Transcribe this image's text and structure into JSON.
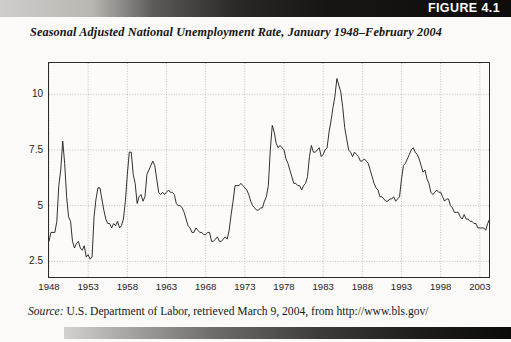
{
  "banner": {
    "figure_label": "FIGURE 4.1"
  },
  "chart_title": "Seasonal Adjusted National Unemployment Rate, January 1948–February 2004",
  "source": {
    "label": "Source:",
    "text": " U.S. Department of Labor, retrieved March 9, 2004, from http://www.bls.gov/"
  },
  "chart_data": {
    "type": "line",
    "title": "Seasonal Adjusted National Unemployment Rate, January 1948–February 2004",
    "xlabel": "",
    "ylabel": "",
    "xlim": [
      1948.0,
      2004.17
    ],
    "ylim": [
      1.8,
      11.4
    ],
    "ytick_labels": [
      "2.5",
      "5",
      "7.5",
      "10"
    ],
    "yticks": [
      2.5,
      5,
      7.5,
      10
    ],
    "xtick_labels": [
      "1948",
      "1953",
      "1958",
      "1963",
      "1968",
      "1973",
      "1978",
      "1983",
      "1988",
      "1993",
      "1998",
      "2003"
    ],
    "xticks": [
      1948,
      1953,
      1958,
      1963,
      1968,
      1973,
      1978,
      1983,
      1988,
      1993,
      1998,
      2003
    ],
    "grid": true,
    "grid_style": "dotted",
    "legend": "none",
    "line_color": "#1a1a1a",
    "series": [
      {
        "name": "Unemployment Rate (%)",
        "x_start": 1948.0,
        "x_step": 0.25,
        "units": "percent",
        "values": [
          3.4,
          3.8,
          3.8,
          3.8,
          4.3,
          5.9,
          6.6,
          7.9,
          6.9,
          5.4,
          4.5,
          4.3,
          3.4,
          3.1,
          3.3,
          3.4,
          3.1,
          3.0,
          3.2,
          2.7,
          2.8,
          2.6,
          2.7,
          4.5,
          5.3,
          5.8,
          5.8,
          5.3,
          4.8,
          4.4,
          4.2,
          4.2,
          4.0,
          4.2,
          4.1,
          4.3,
          4.0,
          4.1,
          4.4,
          5.2,
          6.4,
          7.4,
          7.4,
          6.4,
          6.0,
          5.1,
          5.4,
          5.5,
          5.2,
          5.4,
          6.4,
          6.6,
          6.8,
          7.0,
          6.8,
          6.2,
          5.6,
          5.5,
          5.6,
          5.5,
          5.6,
          5.7,
          5.6,
          5.6,
          5.5,
          5.1,
          5.0,
          5.0,
          4.9,
          4.7,
          4.4,
          4.1,
          4.0,
          3.8,
          3.8,
          4.0,
          3.9,
          3.8,
          3.8,
          3.7,
          3.7,
          3.8,
          3.8,
          3.4,
          3.4,
          3.5,
          3.6,
          3.4,
          3.4,
          3.5,
          3.6,
          3.5,
          3.9,
          4.6,
          5.2,
          5.9,
          5.9,
          5.9,
          6.0,
          5.9,
          5.8,
          5.7,
          5.5,
          5.2,
          5.0,
          4.9,
          4.8,
          4.8,
          4.9,
          4.9,
          5.2,
          5.4,
          5.9,
          7.5,
          8.6,
          8.3,
          7.8,
          7.6,
          7.7,
          7.6,
          7.5,
          7.1,
          6.9,
          6.6,
          6.3,
          6.0,
          6.0,
          5.9,
          5.9,
          5.7,
          5.9,
          6.0,
          6.3,
          7.2,
          7.7,
          7.4,
          7.4,
          7.5,
          7.6,
          7.2,
          7.3,
          7.5,
          7.6,
          8.3,
          8.8,
          9.4,
          9.9,
          10.7,
          10.4,
          10.1,
          9.4,
          8.5,
          8.0,
          7.5,
          7.4,
          7.2,
          7.4,
          7.3,
          7.2,
          7.0,
          7.0,
          7.1,
          7.0,
          6.9,
          6.6,
          6.3,
          6.0,
          5.8,
          5.7,
          5.4,
          5.4,
          5.3,
          5.2,
          5.2,
          5.3,
          5.3,
          5.4,
          5.2,
          5.3,
          5.4,
          6.2,
          6.8,
          6.9,
          7.1,
          7.3,
          7.5,
          7.6,
          7.4,
          7.3,
          7.1,
          6.8,
          6.5,
          6.6,
          6.2,
          6.0,
          5.6,
          5.5,
          5.6,
          5.7,
          5.6,
          5.6,
          5.4,
          5.2,
          5.3,
          5.3,
          5.0,
          4.9,
          4.7,
          4.7,
          4.7,
          4.5,
          4.4,
          4.6,
          4.4,
          4.4,
          4.3,
          4.3,
          4.2,
          4.2,
          4.0,
          4.0,
          4.0,
          4.0,
          3.9,
          4.2,
          4.4,
          4.8,
          5.6,
          5.7,
          5.8,
          5.7,
          5.9,
          5.8,
          6.1,
          6.1,
          5.9,
          5.7,
          5.6
        ]
      }
    ],
    "annotations": [
      {
        "label": "1949 recession peak",
        "x": 1949.75,
        "y": 7.9
      },
      {
        "label": "1958 recession peak",
        "x": 1958.5,
        "y": 7.4
      },
      {
        "label": "1975 recession peak",
        "x": 1975.25,
        "y": 8.6
      },
      {
        "label": "1982 recession peak",
        "x": 1982.75,
        "y": 10.7
      },
      {
        "label": "1992 recession peak",
        "x": 1992.5,
        "y": 7.6
      },
      {
        "label": "2000 trough",
        "x": 2000.5,
        "y": 3.9
      },
      {
        "label": "Feb 2004",
        "x": 2004.08,
        "y": 5.6
      }
    ]
  }
}
